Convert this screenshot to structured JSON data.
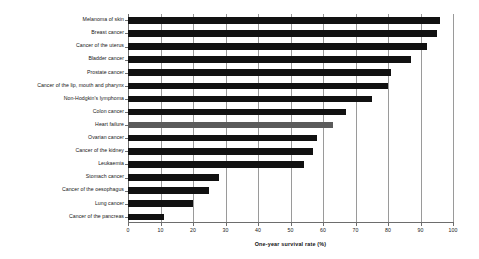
{
  "chart_data": {
    "type": "bar",
    "orientation": "horizontal",
    "title": "",
    "xlabel": "One-year survival rate (%)",
    "ylabel": "",
    "xlim": [
      0,
      100
    ],
    "xticks": [
      0,
      10,
      20,
      30,
      40,
      50,
      60,
      70,
      80,
      90,
      100
    ],
    "xtick_labels": [
      "0",
      "10",
      "20",
      "30",
      "40",
      "50",
      "60",
      "70",
      "80",
      "90",
      "100"
    ],
    "grid": true,
    "grid_axis": "x",
    "legend": "none",
    "categories": [
      "Melanoma of skin",
      "Breast cancer",
      "Cancer of the uterus",
      "Bladder cancer",
      "Prostate cancer",
      "Cancer of the lip, mouth and pharynx",
      "Non-Hodgkin's lymphoma",
      "Colon cancer",
      "Heart failure",
      "Ovarian cancer",
      "Cancer of the kidney",
      "Leukaemia",
      "Stomach cancer",
      "Cancer of the oesophagus",
      "Lung cancer",
      "Cancer of the pancreas"
    ],
    "values": [
      96,
      95,
      92,
      87,
      81,
      80,
      75,
      67,
      63,
      58,
      57,
      54,
      28,
      25,
      20,
      11
    ],
    "bar_colors": [
      "#111111",
      "#111111",
      "#111111",
      "#111111",
      "#111111",
      "#111111",
      "#111111",
      "#111111",
      "#5b5b5b",
      "#111111",
      "#111111",
      "#111111",
      "#111111",
      "#111111",
      "#111111",
      "#111111"
    ],
    "highlight_category": "Heart failure",
    "colors": {
      "bar_default": "#111111",
      "bar_highlight": "#5b5b5b",
      "axis": "#6d6d6d",
      "gridline": "#9a9a9a",
      "text": "#161616",
      "background": "#ffffff"
    }
  }
}
